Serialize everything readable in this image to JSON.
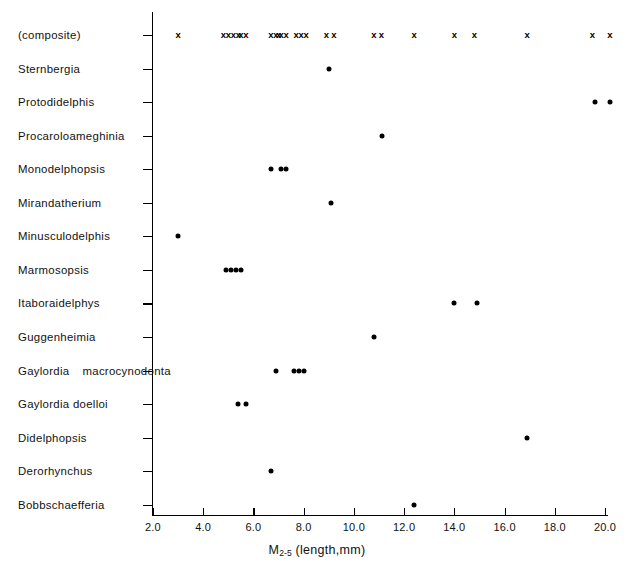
{
  "chart_data": {
    "type": "scatter",
    "title": "",
    "xlabel": "M2-5 (length,mm)",
    "xlabel_base": "M",
    "xlabel_sub": "2-5",
    "xlabel_rest": " (length,mm)",
    "ylabel": "",
    "xlim": [
      2.0,
      20.8
    ],
    "grid": false,
    "legend": "none",
    "xticks": [
      2.0,
      4.0,
      6.0,
      8.0,
      10.0,
      12.0,
      14.0,
      16.0,
      18.0,
      20.0
    ],
    "xticklabels": [
      "2.0",
      "4.0",
      "6.0",
      "8.0",
      "10.0",
      "12.0",
      "14.0",
      "16.0",
      "18.0",
      "20.0"
    ],
    "marker_composite": "x",
    "marker_taxon": "filled-circle",
    "categories": [
      "(composite)",
      "Sternbergia",
      "Protodidelphis",
      "Procaroloameghinia",
      "Monodelphopsis",
      "Mirandatherium",
      "Minusculodelphis",
      "Marmosopsis",
      "Itaboraidelphys",
      "Guggenheimia",
      "Gaylordia macrocynodonta",
      "Gaylordia doelloi",
      "Didelphopsis",
      "Derorhynchus",
      "Bobbschaefferia"
    ],
    "rows": [
      {
        "label": "(composite)",
        "label_lines": [
          "(composite)"
        ],
        "marker": "x",
        "values": [
          3.0,
          4.8,
          5.0,
          5.2,
          5.4,
          5.5,
          5.7,
          6.7,
          6.9,
          7.0,
          7.1,
          7.3,
          7.7,
          7.9,
          8.1,
          8.9,
          9.2,
          10.8,
          11.1,
          12.4,
          14.0,
          14.8,
          16.9,
          19.5,
          20.2
        ]
      },
      {
        "label": "Sternbergia",
        "label_lines": [
          "Sternbergia"
        ],
        "marker": "filled-circle",
        "values": [
          9.0
        ]
      },
      {
        "label": "Protodidelphis",
        "label_lines": [
          "Protodidelphis"
        ],
        "marker": "filled-circle",
        "values": [
          19.6,
          20.2
        ]
      },
      {
        "label": "Procaroloameghinia",
        "label_lines": [
          "Procaroloameghinia"
        ],
        "marker": "filled-circle",
        "values": [
          11.1
        ]
      },
      {
        "label": "Monodelphopsis",
        "label_lines": [
          "Monodelphopsis"
        ],
        "marker": "filled-circle",
        "values": [
          6.7,
          7.1,
          7.3
        ]
      },
      {
        "label": "Mirandatherium",
        "label_lines": [
          "Mirandatherium"
        ],
        "marker": "filled-circle",
        "values": [
          9.1
        ]
      },
      {
        "label": "Minusculodelphis",
        "label_lines": [
          "Minusculodelphis"
        ],
        "marker": "filled-circle",
        "values": [
          3.0
        ]
      },
      {
        "label": "Marmosopsis",
        "label_lines": [
          "Marmosopsis"
        ],
        "marker": "filled-circle",
        "values": [
          4.9,
          5.1,
          5.3,
          5.5
        ]
      },
      {
        "label": "Itaboraidelphys",
        "label_lines": [
          "Itaboraidelphys"
        ],
        "marker": "filled-circle",
        "values": [
          14.0,
          14.9
        ]
      },
      {
        "label": "Guggenheimia",
        "label_lines": [
          "Guggenheimia"
        ],
        "marker": "filled-circle",
        "values": [
          10.8
        ]
      },
      {
        "label": "Gaylordia macrocynodonta",
        "label_lines": [
          "Gaylordia",
          "macrocynodonta"
        ],
        "marker": "filled-circle",
        "values": [
          6.9,
          7.6,
          7.8,
          8.0
        ]
      },
      {
        "label": "Gaylordia doelloi",
        "label_lines": [
          "Gaylordia  doelloi"
        ],
        "marker": "filled-circle",
        "values": [
          5.4,
          5.7
        ]
      },
      {
        "label": "Didelphopsis",
        "label_lines": [
          "Didelphopsis"
        ],
        "marker": "filled-circle",
        "values": [
          16.9
        ]
      },
      {
        "label": "Derorhynchus",
        "label_lines": [
          "Derorhynchus"
        ],
        "marker": "filled-circle",
        "values": [
          6.7
        ]
      },
      {
        "label": "Bobbschaefferia",
        "label_lines": [
          "Bobbschaefferia"
        ],
        "marker": "filled-circle",
        "values": [
          12.4
        ]
      }
    ]
  },
  "colors": {
    "axis": "#000000",
    "marker": "#000000",
    "text": "#111111",
    "background": "#ffffff"
  }
}
